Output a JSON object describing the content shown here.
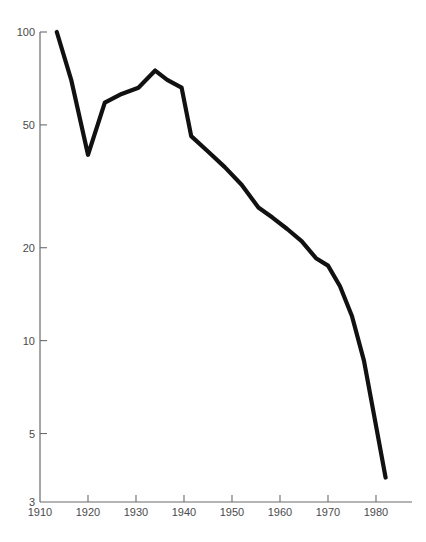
{
  "chart_data": {
    "type": "line",
    "title": "",
    "subtitle": "",
    "xlabel": "",
    "ylabel": "",
    "grid": false,
    "legend": false,
    "legend_position": "none",
    "yscale": "log",
    "xscale": "linear",
    "xlim": [
      1910,
      1987
    ],
    "ylim": [
      3,
      100
    ],
    "x_tick_labels": [
      "1910",
      "1920",
      "1930",
      "1940",
      "1950",
      "1960",
      "1970",
      "1980"
    ],
    "x_ticks": [
      1910,
      1920,
      1930,
      1940,
      1950,
      1960,
      1970,
      1980
    ],
    "y_tick_labels": [
      "100",
      "50",
      "20",
      "10",
      "5",
      "3"
    ],
    "y_ticks": [
      100,
      50,
      20,
      10,
      5,
      3
    ],
    "series": [
      {
        "name": "series-1",
        "color": "#111111",
        "x": [
          1913.5,
          1916.5,
          1920.0,
          1923.5,
          1927.0,
          1930.5,
          1934.0,
          1936.5,
          1939.5,
          1941.5,
          1945.0,
          1948.5,
          1952.0,
          1955.5,
          1958.5,
          1961.5,
          1964.5,
          1967.5,
          1970.0,
          1972.5,
          1975.0,
          1977.5,
          1980.0,
          1982.0
        ],
        "y": [
          100.0,
          70.0,
          40.0,
          59.0,
          63.0,
          66.0,
          75.0,
          70.0,
          66.0,
          46.0,
          41.0,
          36.5,
          32.0,
          27.0,
          25.0,
          23.0,
          21.0,
          18.5,
          17.5,
          15.0,
          12.0,
          8.6,
          5.3,
          3.6
        ]
      }
    ]
  },
  "axes": {
    "y_axis_name": "y-axis-log-scale",
    "x_axis_name": "x-axis-years"
  }
}
